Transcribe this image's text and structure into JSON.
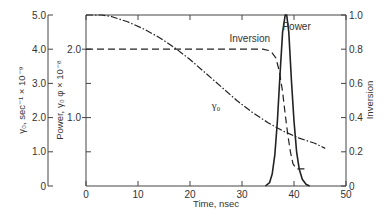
{
  "chart_data": {
    "type": "line",
    "title": "",
    "xlabel": "Time, nsec",
    "xlim": [
      0,
      50
    ],
    "x_ticks": [
      0,
      10,
      20,
      30,
      40,
      50
    ],
    "axes": {
      "gamma0": {
        "label": "γ₀, sec⁻¹ × 10⁻⁹",
        "ylim": [
          0,
          5.0
        ],
        "ticks": [
          "0",
          "1.0",
          "2.0",
          "3.0",
          "4.0",
          "5.0"
        ],
        "tick_values": [
          0,
          1,
          2,
          3,
          4,
          5
        ]
      },
      "power": {
        "label": "Power, γ₀ φ × 10⁻⁸",
        "ylim": [
          0,
          2.5
        ],
        "ticks": [
          "1.0",
          "2.0"
        ],
        "tick_values": [
          1,
          2
        ]
      },
      "inversion": {
        "label": "Inversion",
        "ylim": [
          0,
          1.0
        ],
        "ticks": [
          "0",
          "0.2",
          "0.4",
          "0.6",
          "0.8",
          "1.0"
        ],
        "tick_values": [
          0,
          0.2,
          0.4,
          0.6,
          0.8,
          1.0
        ]
      }
    },
    "grid": false,
    "series": [
      {
        "name": "γ₀",
        "label": "γ₀",
        "axis": "gamma0",
        "style": "dash-dot",
        "x": [
          0,
          3,
          5,
          8,
          11,
          14,
          17,
          20,
          23,
          26,
          29,
          32,
          35,
          38,
          41,
          44,
          46
        ],
        "values": [
          5.0,
          5.0,
          4.95,
          4.8,
          4.6,
          4.35,
          4.05,
          3.7,
          3.3,
          2.9,
          2.5,
          2.15,
          1.85,
          1.6,
          1.4,
          1.25,
          1.1
        ]
      },
      {
        "name": "Inversion",
        "label": "Inversion",
        "axis": "inversion",
        "style": "dashed",
        "x": [
          0,
          10,
          20,
          30,
          34,
          35.5,
          36.5,
          37.2,
          37.8,
          38.3,
          38.8,
          39.3,
          39.8,
          40.5,
          42
        ],
        "values": [
          0.8,
          0.8,
          0.8,
          0.8,
          0.8,
          0.79,
          0.75,
          0.67,
          0.55,
          0.42,
          0.3,
          0.2,
          0.13,
          0.1,
          0.1
        ]
      },
      {
        "name": "Power",
        "label": "Power",
        "axis": "inversion",
        "style": "solid",
        "x": [
          34.5,
          35.3,
          35.8,
          36.3,
          36.8,
          37.3,
          37.8,
          38.3,
          38.6,
          39.0,
          39.5,
          40.0,
          40.5,
          41.0,
          41.6,
          42.3,
          43.0
        ],
        "values": [
          0.0,
          0.02,
          0.07,
          0.18,
          0.38,
          0.65,
          0.9,
          1.0,
          1.0,
          0.9,
          0.62,
          0.38,
          0.2,
          0.1,
          0.04,
          0.01,
          0.0
        ]
      }
    ],
    "annotations": [
      {
        "text": "Inversion",
        "x": 31.5,
        "y_inversion": 0.84
      },
      {
        "text": "Power",
        "x": 40.5,
        "y_inversion": 0.91
      },
      {
        "text": "γ₀",
        "x": 25,
        "y_inversion": 0.45
      }
    ]
  }
}
